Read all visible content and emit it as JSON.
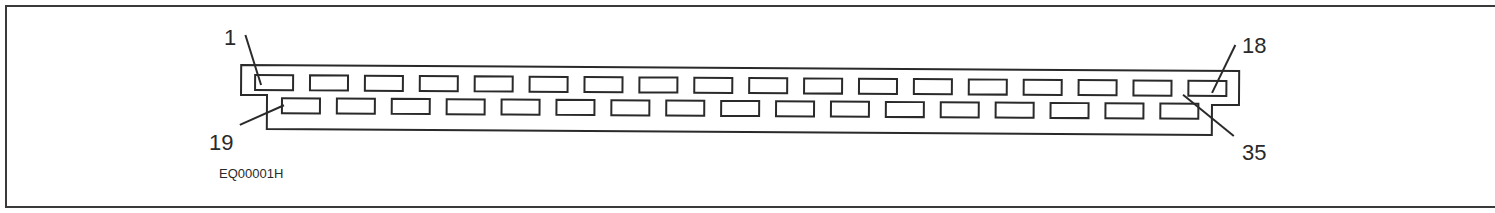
{
  "figure": {
    "id_label": "EQ00001H",
    "connector": {
      "pin_count": 35,
      "top_row": {
        "first_pin": 1,
        "last_pin": 18,
        "count": 18
      },
      "bottom_row": {
        "first_pin": 19,
        "last_pin": 35,
        "count": 17
      }
    },
    "callouts": [
      {
        "pin": "1"
      },
      {
        "pin": "18"
      },
      {
        "pin": "19"
      },
      {
        "pin": "35"
      }
    ],
    "colors": {
      "line": "#2a2a2a",
      "background": "#ffffff"
    }
  }
}
